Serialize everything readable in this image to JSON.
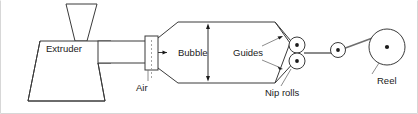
{
  "diagram": {
    "labels": {
      "extruder": "Extruder",
      "air": "Air",
      "bubble": "Bubble",
      "guides": "Guides",
      "nip_rolls": "Nip rolls",
      "reel": "Reel"
    },
    "colors": {
      "outline": "#3a3a3a",
      "web": "#6e6e6e",
      "dot": "#1a1a1a",
      "background": "#ffffff",
      "frame": "#d7d7d7"
    },
    "components": [
      {
        "name": "hopper",
        "shape": "inverted-trapezoid",
        "description": "Feed hopper on top of extruder"
      },
      {
        "name": "extruder-body",
        "shape": "trapezoid",
        "description": "Extruder drive housing"
      },
      {
        "name": "barrel",
        "shape": "rectangle",
        "description": "Horizontal extruder barrel to die"
      },
      {
        "name": "die-block",
        "shape": "rectangle",
        "description": "Annular die with air inlet"
      },
      {
        "name": "bubble",
        "shape": "hexagon",
        "description": "Inflated film bubble"
      },
      {
        "name": "guides",
        "shape": "converging-lines",
        "description": "Collapsing frame guides"
      },
      {
        "name": "nip-rolls",
        "shape": "two-tangent-circles",
        "count": 2,
        "description": "Pair of counter-rotating nip rolls"
      },
      {
        "name": "idler-roll",
        "shape": "circle",
        "count": 1,
        "description": "Small idler roller"
      },
      {
        "name": "reel",
        "shape": "circle",
        "description": "Film wind-up reel"
      }
    ],
    "annotations": [
      {
        "name": "air-leader",
        "from": "Air",
        "to": "die-block"
      },
      {
        "name": "bubble-dimension",
        "from": "Bubble",
        "to": "bubble-height",
        "style": "double-headed-arrow"
      },
      {
        "name": "guides-leader-upper",
        "from": "Guides",
        "to": "upper-guide-line"
      },
      {
        "name": "guides-leader-lower",
        "from": "Guides",
        "to": "lower-guide-line"
      },
      {
        "name": "nip-leader",
        "from": "Nip rolls",
        "to": "nip-rolls"
      },
      {
        "name": "reel-leader",
        "from": "Reel",
        "to": "reel"
      },
      {
        "name": "melt-flow-arrow",
        "from": "barrel",
        "to": "die-block",
        "style": "solid-arrowhead"
      }
    ]
  }
}
